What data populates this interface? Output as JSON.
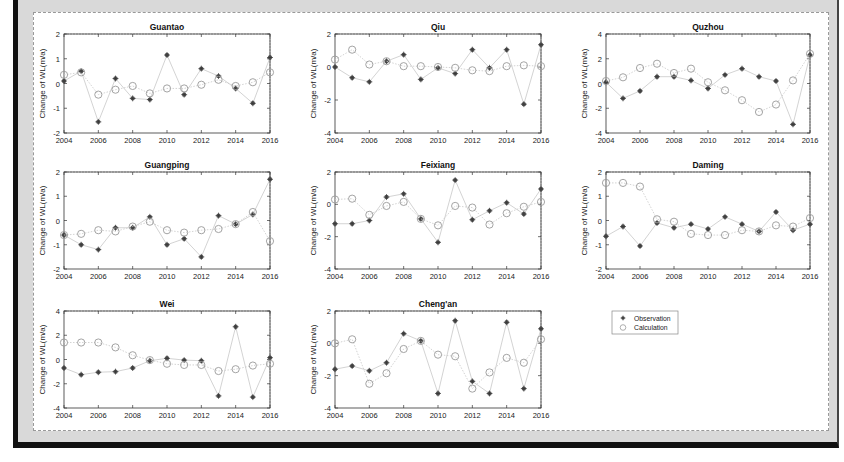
{
  "figure": {
    "ylabel": "Change of WL(m/a)",
    "xticks": [
      "2004",
      "2006",
      "2008",
      "2010",
      "2012",
      "2014",
      "2016"
    ],
    "legend": {
      "observation_label": "Observation",
      "calculation_label": "Calculation",
      "observation_marker": "asterisk-icon",
      "calculation_marker": "circle-icon"
    },
    "colors": {
      "observation": "#555555",
      "calculation": "#9a9a9a",
      "line": "#c8c8c8",
      "axis": "#333333"
    }
  },
  "chart_data": {
    "type": "scatter",
    "layout": "3x3 grid of small multiples (8 panels + legend)",
    "x": [
      2004,
      2005,
      2006,
      2007,
      2008,
      2009,
      2010,
      2011,
      2012,
      2013,
      2014,
      2015,
      2016
    ],
    "xlabel": "",
    "ylabel": "Change of WL(m/a)",
    "xlim": [
      2004,
      2016
    ],
    "legend": [
      "Observation",
      "Calculation"
    ],
    "legend_position": "row 3, column 3 (top-left of cell)",
    "grid": false,
    "panels": [
      {
        "title": "Guantao",
        "ylim": [
          -2,
          2
        ],
        "yticks": [
          -2,
          -1,
          0,
          1,
          2
        ],
        "series": [
          {
            "name": "Observation",
            "marker": "asterisk",
            "values": [
              0.1,
              0.5,
              -1.55,
              0.2,
              -0.6,
              -0.65,
              1.15,
              -0.45,
              0.6,
              0.3,
              -0.2,
              -0.8,
              1.05
            ]
          },
          {
            "name": "Calculation",
            "marker": "circle",
            "values": [
              0.35,
              0.45,
              -0.45,
              -0.25,
              -0.1,
              -0.4,
              -0.2,
              -0.2,
              -0.05,
              0.15,
              -0.1,
              0.05,
              0.45
            ]
          }
        ]
      },
      {
        "title": "Qiu",
        "ylim": [
          -4,
          2
        ],
        "yticks": [
          -4,
          -2,
          0,
          2
        ],
        "series": [
          {
            "name": "Observation",
            "marker": "asterisk",
            "values": [
              0.0,
              -0.65,
              -0.9,
              0.35,
              0.75,
              -0.75,
              -0.05,
              -0.4,
              1.05,
              -0.05,
              1.05,
              -2.25,
              1.35
            ]
          },
          {
            "name": "Calculation",
            "marker": "circle",
            "values": [
              0.45,
              1.05,
              0.15,
              0.35,
              0.05,
              0.05,
              0.0,
              -0.05,
              -0.2,
              -0.25,
              0.05,
              0.1,
              0.05
            ]
          }
        ]
      },
      {
        "title": "Quzhou",
        "ylim": [
          -4,
          4
        ],
        "yticks": [
          -4,
          -2,
          0,
          2,
          4
        ],
        "series": [
          {
            "name": "Observation",
            "marker": "asterisk",
            "values": [
              0.1,
              -1.2,
              -0.6,
              0.55,
              0.55,
              0.25,
              -0.4,
              0.7,
              1.2,
              0.55,
              0.2,
              -3.3,
              2.3
            ]
          },
          {
            "name": "Calculation",
            "marker": "circle",
            "values": [
              0.2,
              0.5,
              1.25,
              1.6,
              0.85,
              1.2,
              0.1,
              -0.55,
              -1.35,
              -2.3,
              -1.7,
              0.25,
              2.4
            ]
          }
        ]
      },
      {
        "title": "Guangping",
        "ylim": [
          -2,
          2
        ],
        "yticks": [
          -2,
          -1,
          0,
          1,
          2
        ],
        "series": [
          {
            "name": "Observation",
            "marker": "asterisk",
            "values": [
              -0.6,
              -1.0,
              -1.2,
              -0.3,
              -0.3,
              0.15,
              -1.0,
              -0.75,
              -1.5,
              0.2,
              -0.15,
              0.25,
              1.7
            ]
          },
          {
            "name": "Calculation",
            "marker": "circle",
            "values": [
              -0.6,
              -0.55,
              -0.4,
              -0.45,
              -0.25,
              -0.05,
              -0.4,
              -0.5,
              -0.4,
              -0.35,
              -0.15,
              0.35,
              -0.85
            ]
          }
        ]
      },
      {
        "title": "Feixiang",
        "ylim": [
          -4,
          2
        ],
        "yticks": [
          -4,
          -2,
          0,
          2
        ],
        "series": [
          {
            "name": "Observation",
            "marker": "asterisk",
            "values": [
              -1.2,
              -1.2,
              -1.0,
              0.45,
              0.65,
              -0.9,
              -2.35,
              1.5,
              -0.95,
              -0.4,
              0.1,
              -0.6,
              0.95
            ]
          },
          {
            "name": "Calculation",
            "marker": "circle",
            "values": [
              0.3,
              0.35,
              -0.65,
              -0.1,
              0.15,
              -0.9,
              -1.3,
              -0.1,
              -0.2,
              -1.25,
              -0.55,
              -0.15,
              0.15
            ]
          }
        ]
      },
      {
        "title": "Daming",
        "ylim": [
          -2,
          2
        ],
        "yticks": [
          -2,
          -1,
          0,
          1,
          2
        ],
        "series": [
          {
            "name": "Observation",
            "marker": "asterisk",
            "values": [
              -0.65,
              -0.25,
              -1.05,
              -0.1,
              -0.3,
              -0.15,
              -0.35,
              0.15,
              -0.15,
              -0.45,
              0.35,
              -0.4,
              -0.15
            ]
          },
          {
            "name": "Calculation",
            "marker": "circle",
            "values": [
              1.55,
              1.55,
              1.4,
              0.05,
              -0.05,
              -0.55,
              -0.6,
              -0.6,
              -0.4,
              -0.45,
              -0.2,
              -0.25,
              0.1
            ]
          }
        ]
      },
      {
        "title": "Wei",
        "ylim": [
          -4,
          4
        ],
        "yticks": [
          -4,
          -2,
          0,
          2,
          4
        ],
        "series": [
          {
            "name": "Observation",
            "marker": "asterisk",
            "values": [
              -0.7,
              -1.25,
              -1.05,
              -1.0,
              -0.7,
              -0.1,
              0.1,
              -0.05,
              -0.1,
              -3.0,
              2.7,
              -3.1,
              0.15
            ]
          },
          {
            "name": "Calculation",
            "marker": "circle",
            "values": [
              1.4,
              1.4,
              1.4,
              1.0,
              0.35,
              -0.05,
              -0.35,
              -0.45,
              -0.45,
              -0.95,
              -0.8,
              -0.5,
              -0.35
            ]
          }
        ]
      },
      {
        "title": "Cheng'an",
        "ylim": [
          -4,
          2
        ],
        "yticks": [
          -4,
          -2,
          0,
          2
        ],
        "series": [
          {
            "name": "Observation",
            "marker": "asterisk",
            "values": [
              -1.6,
              -1.4,
              -1.7,
              -1.2,
              0.6,
              0.15,
              -3.1,
              1.4,
              -2.35,
              -3.1,
              1.3,
              -2.8,
              0.9
            ]
          },
          {
            "name": "Calculation",
            "marker": "circle",
            "values": [
              0.0,
              0.25,
              -2.5,
              -1.85,
              -0.35,
              0.15,
              -0.7,
              -0.8,
              -2.8,
              -1.8,
              -0.9,
              -1.2,
              0.25
            ]
          }
        ]
      }
    ]
  }
}
